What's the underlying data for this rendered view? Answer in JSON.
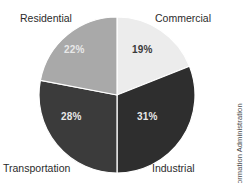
{
  "chart_data": {
    "type": "pie",
    "title": "",
    "subtitle": "",
    "xlabel": "",
    "ylabel": "",
    "legend_position": "none",
    "grid": false,
    "categories": [
      "Commercial",
      "Industrial",
      "Transportation",
      "Residential"
    ],
    "values": [
      19,
      31,
      28,
      22
    ],
    "value_labels": [
      "19%",
      "31%",
      "28%",
      "22%"
    ],
    "units": "percent",
    "total": 100,
    "start_angle_deg": 0,
    "direction": "clockwise",
    "slices": [
      {
        "name": "Commercial",
        "value": 19,
        "value_label": "19%",
        "color": "#ececec",
        "label_color": "#3a3a3a",
        "label_position": "top-right",
        "start_angle_deg": 0,
        "end_angle_deg": 68.4
      },
      {
        "name": "Industrial",
        "value": 31,
        "value_label": "31%",
        "color": "#2e2e2e",
        "label_color": "#e8e8e8",
        "label_position": "bottom-right",
        "start_angle_deg": 68.4,
        "end_angle_deg": 180.0
      },
      {
        "name": "Transportation",
        "value": 28,
        "value_label": "28%",
        "color": "#3b3b3b",
        "label_color": "#e8e8e8",
        "label_position": "bottom-left",
        "start_angle_deg": 180.0,
        "end_angle_deg": 280.8
      },
      {
        "name": "Residential",
        "value": 22,
        "value_label": "22%",
        "color": "#a9a9a9",
        "label_color": "#ffffff",
        "label_position": "top-left",
        "start_angle_deg": 280.8,
        "end_angle_deg": 360.0
      }
    ]
  },
  "chart": {
    "center_x": 78,
    "center_y": 83,
    "radius": 78,
    "outline_color": "#ffffff",
    "background": "#ffffff"
  },
  "credit": {
    "text": "© U.S. Energy Information Administration",
    "orientation": "vertical"
  }
}
